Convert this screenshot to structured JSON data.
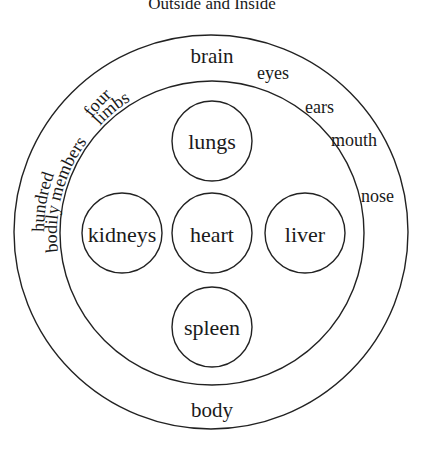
{
  "title": "Outside and Inside",
  "outer_ring": {
    "bottom_label": "body",
    "labels": {
      "brain": "brain",
      "eyes": "eyes",
      "ears": "ears",
      "mouth": "mouth",
      "nose": "nose",
      "four": "four",
      "limbs": "limbs",
      "hundred": "hundred",
      "bodily_members": "bodily members"
    }
  },
  "organs": [
    {
      "name": "lungs"
    },
    {
      "name": "kidneys"
    },
    {
      "name": "heart"
    },
    {
      "name": "liver"
    },
    {
      "name": "spleen"
    }
  ]
}
